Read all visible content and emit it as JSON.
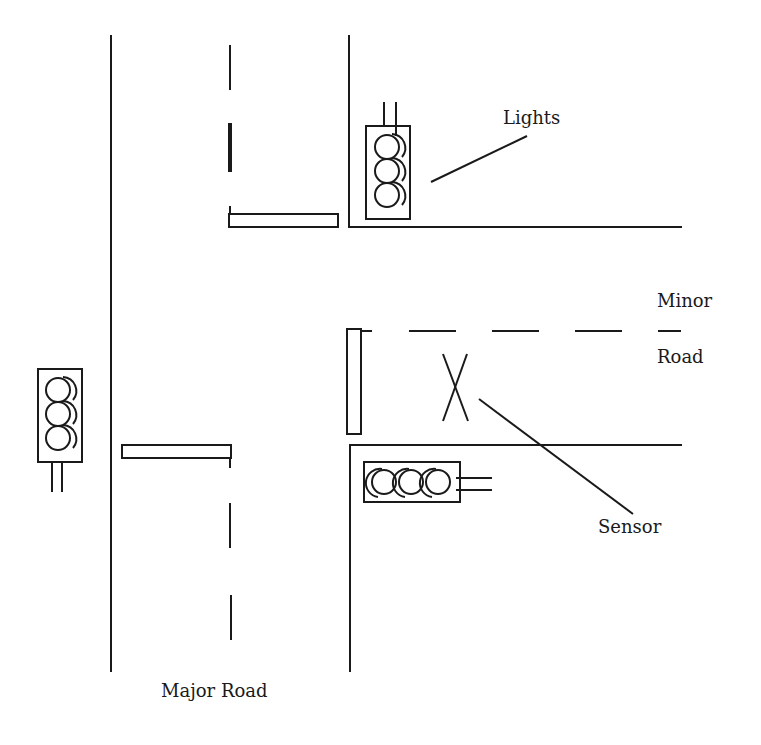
{
  "diagram": {
    "type": "traffic-intersection",
    "labels": {
      "lights": "Lights",
      "minor_road_line1": "Minor",
      "minor_road_line2": "Road",
      "sensor": "Sensor",
      "major_road": "Major Road"
    },
    "elements": [
      {
        "kind": "road",
        "name": "Major Road",
        "orientation": "vertical"
      },
      {
        "kind": "road",
        "name": "Minor Road",
        "orientation": "horizontal",
        "joins": "right side of major road"
      },
      {
        "kind": "traffic-light",
        "position": "top-right corner of minor road junction",
        "lamps": 3
      },
      {
        "kind": "traffic-light",
        "position": "left of major road",
        "lamps": 3
      },
      {
        "kind": "traffic-light",
        "position": "bottom of minor road, horizontal",
        "lamps": 3
      },
      {
        "kind": "stop-line",
        "count": 3
      },
      {
        "kind": "sensor",
        "position": "minor road approach lane"
      }
    ],
    "colors": {
      "ink": "#1a1a1a",
      "background": "#ffffff"
    }
  }
}
